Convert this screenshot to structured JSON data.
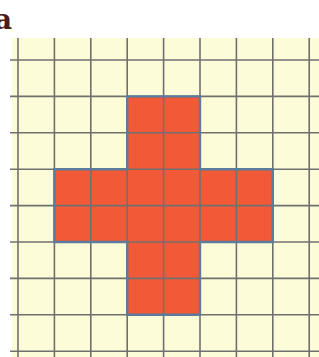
{
  "figure": {
    "label": "a"
  },
  "grid": {
    "origin_x": 18,
    "origin_y": 60,
    "cell_size": 36.4,
    "columns": 8,
    "rows": 8,
    "top_partial_row_from_y": 38,
    "left_line_from_x": 10,
    "colors": {
      "paper": "#fdfcd8",
      "grid_line": "#707070",
      "shape_fill": "#f25a37",
      "shape_border": "#5b7c9c",
      "label": "#4a1c20"
    }
  },
  "shape": {
    "name": "cross",
    "cell_count": 20,
    "cells": [
      [
        3,
        1
      ],
      [
        4,
        1
      ],
      [
        3,
        2
      ],
      [
        4,
        2
      ],
      [
        1,
        3
      ],
      [
        2,
        3
      ],
      [
        3,
        3
      ],
      [
        4,
        3
      ],
      [
        5,
        3
      ],
      [
        6,
        3
      ],
      [
        1,
        4
      ],
      [
        2,
        4
      ],
      [
        3,
        4
      ],
      [
        4,
        4
      ],
      [
        5,
        4
      ],
      [
        6,
        4
      ],
      [
        3,
        5
      ],
      [
        4,
        5
      ],
      [
        3,
        6
      ],
      [
        4,
        6
      ]
    ],
    "outline": [
      [
        3,
        1
      ],
      [
        5,
        1
      ],
      [
        5,
        3
      ],
      [
        7,
        3
      ],
      [
        7,
        5
      ],
      [
        5,
        5
      ],
      [
        5,
        7
      ],
      [
        3,
        7
      ],
      [
        3,
        5
      ],
      [
        1,
        5
      ],
      [
        1,
        3
      ],
      [
        3,
        3
      ]
    ]
  }
}
